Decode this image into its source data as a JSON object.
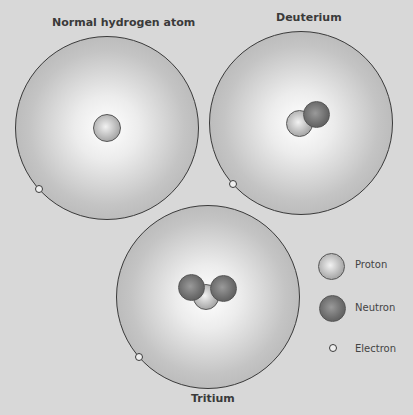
{
  "atoms": [
    {
      "title": "Normal hydrogen atom",
      "protons": 1,
      "neutrons": 0,
      "electrons": 1
    },
    {
      "title": "Deuterium",
      "protons": 1,
      "neutrons": 1,
      "electrons": 1
    },
    {
      "title": "Tritium",
      "protons": 1,
      "neutrons": 2,
      "electrons": 1
    }
  ],
  "legend": {
    "items": [
      {
        "label": "Proton",
        "icon": "proton-sphere"
      },
      {
        "label": "Neutron",
        "icon": "neutron-sphere"
      },
      {
        "label": "Electron",
        "icon": "electron-ring"
      }
    ]
  },
  "colors": {
    "background": "#d8d8d8",
    "outline": "#3a3a3a",
    "proton": "#bdbdbd",
    "neutron": "#6e6e6e"
  }
}
